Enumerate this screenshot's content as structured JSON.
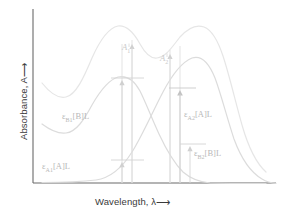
{
  "figure": {
    "background": "#ffffff"
  },
  "axes": {
    "y_label_text": "Absorbance, A",
    "y_label_arrow": "⟶",
    "x_label_text": "Wavelength, λ",
    "x_label_arrow": "⟶",
    "axis_color": "#555555",
    "origin_px": {
      "x": 33,
      "y": 183
    }
  },
  "curves": [
    {
      "name": "total-absorbance-curve",
      "label": "A total (A + B)",
      "color": "#e3e3e3",
      "stroke_width": 1.1,
      "description": "Upper summed spectrum with two broad maxima"
    },
    {
      "name": "species-b-curve",
      "label": "B",
      "color": "#d7d7d7",
      "stroke_width": 1.1,
      "description": "Left-peaking component, decays to baseline at long wavelength"
    },
    {
      "name": "species-a-curve",
      "label": "A",
      "color": "#d7d7d7",
      "stroke_width": 1.1,
      "description": "Right-peaking component, rises from baseline at short wavelength"
    }
  ],
  "annotations": {
    "a1": {
      "label_html": "A<sub>1</sub>",
      "color": "#c9c9c9"
    },
    "a2": {
      "label_html": "A<sub>2</sub>",
      "color": "#c9c9c9"
    },
    "eps_b1": {
      "label_html": "ε<sub>B1</sub>[B]L",
      "color": "#c4c4c4"
    },
    "eps_a1": {
      "label_html": "ε<sub>A1</sub>[A]L",
      "color": "#c4c4c4"
    },
    "eps_a2": {
      "label_html": "ε<sub>A2</sub>[A]L",
      "color": "#c4c4c4"
    },
    "eps_b2": {
      "label_html": "ε<sub>B2</sub>[B]L",
      "color": "#c4c4c4"
    }
  },
  "wavelength_markers": [
    {
      "name": "lambda-1",
      "x_px": 122
    },
    {
      "name": "lambda-1b",
      "x_px": 132
    },
    {
      "name": "lambda-2",
      "x_px": 170
    },
    {
      "name": "lambda-2b",
      "x_px": 180
    }
  ],
  "chart_data": {
    "type": "line",
    "title": "",
    "xlabel": "Wavelength, λ",
    "ylabel": "Absorbance, A",
    "xlim": [
      0,
      100
    ],
    "ylim": [
      0,
      100
    ],
    "grid": false,
    "legend": "none",
    "x": [
      0,
      5,
      10,
      15,
      20,
      25,
      30,
      35,
      40,
      45,
      50,
      55,
      60,
      65,
      70,
      75,
      80,
      85,
      90,
      95,
      100
    ],
    "series": [
      {
        "name": "A_total",
        "label": "A total",
        "color": "#e3e3e3",
        "values": [
          52,
          44,
          38,
          36,
          40,
          50,
          64,
          77,
          86,
          90,
          88,
          83,
          79,
          78,
          80,
          85,
          90,
          92,
          88,
          74,
          52
        ]
      },
      {
        "name": "B",
        "label": "ε B [B] L",
        "color": "#d7d7d7",
        "values": [
          30,
          26,
          24,
          25,
          30,
          38,
          48,
          57,
          63,
          65,
          63,
          57,
          48,
          38,
          29,
          21,
          15,
          10,
          7,
          5,
          4
        ]
      },
      {
        "name": "A",
        "label": "ε A [A] L",
        "color": "#d7d7d7",
        "values": [
          1,
          1,
          2,
          3,
          5,
          8,
          13,
          19,
          26,
          35,
          45,
          55,
          64,
          71,
          76,
          78,
          76,
          70,
          60,
          46,
          30
        ]
      }
    ],
    "annotations": [
      {
        "text": "A₁",
        "x": 33,
        "y": 86,
        "note": "total absorbance at wavelength 1"
      },
      {
        "text": "A₂",
        "x": 56,
        "y": 79,
        "note": "total absorbance at wavelength 2"
      },
      {
        "text": "εB1[B]L",
        "x": 33,
        "note": "B contribution at wavelength 1"
      },
      {
        "text": "εA1[A]L",
        "x": 33,
        "note": "A contribution at wavelength 1"
      },
      {
        "text": "εA2[A]L",
        "x": 56,
        "note": "A contribution at wavelength 2"
      },
      {
        "text": "εB2[B]L",
        "x": 56,
        "note": "B contribution at wavelength 2"
      }
    ]
  }
}
